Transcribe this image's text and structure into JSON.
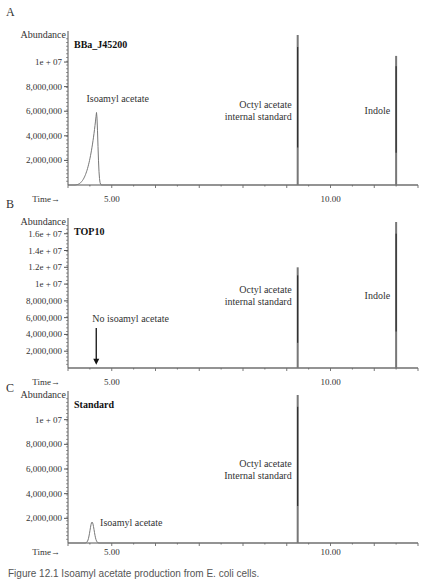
{
  "figure": {
    "caption": "Figure 12.1 Isoamyl acetate production from E. coli cells."
  },
  "colors": {
    "axis": "#555555",
    "trace": "#777777",
    "trace_dark": "#222222",
    "text": "#333333"
  },
  "chart_data": [
    {
      "type": "line",
      "panel_label": "A",
      "title": "BBa_J45200",
      "xlabel": "Time→",
      "ylabel": "Abundance",
      "x_ticks": [
        {
          "value": 5.0,
          "label": "5.00"
        },
        {
          "value": 10.0,
          "label": "10.00"
        }
      ],
      "xlim": [
        4.0,
        12.0
      ],
      "y_ticks": [
        {
          "value": 2000000,
          "label": "2,000,000"
        },
        {
          "value": 4000000,
          "label": "4,000,000"
        },
        {
          "value": 6000000,
          "label": "6,000,000"
        },
        {
          "value": 8000000,
          "label": "8,000,000"
        },
        {
          "value": 10000000,
          "label": "1e + 07"
        }
      ],
      "ylim": [
        0,
        12200000
      ],
      "peaks": [
        {
          "name": "Isoamyl acetate",
          "label_lines": [
            "Isoamyl acetate"
          ],
          "rt": 4.65,
          "height": 5900000,
          "width": 0.55,
          "shape": "broad"
        },
        {
          "name": "Octyl acetate internal standard",
          "label_lines": [
            "Octyl acetate",
            "internal standard"
          ],
          "rt": 9.25,
          "height": 12200000,
          "width": 0.03,
          "shape": "sharp"
        },
        {
          "name": "Indole",
          "label_lines": [
            "Indole"
          ],
          "rt": 11.5,
          "height": 10500000,
          "width": 0.03,
          "shape": "sharp"
        }
      ],
      "annotations": []
    },
    {
      "type": "line",
      "panel_label": "B",
      "title": "TOP10",
      "xlabel": "Time→",
      "ylabel": "Abundance",
      "x_ticks": [
        {
          "value": 5.0,
          "label": "5.00"
        },
        {
          "value": 10.0,
          "label": "10.00"
        }
      ],
      "xlim": [
        4.0,
        12.0
      ],
      "y_ticks": [
        {
          "value": 2000000,
          "label": "2,000,000"
        },
        {
          "value": 4000000,
          "label": "4,000,000"
        },
        {
          "value": 6000000,
          "label": "6,000,000"
        },
        {
          "value": 8000000,
          "label": "8,000,000"
        },
        {
          "value": 10000000,
          "label": "1e + 07"
        },
        {
          "value": 12000000,
          "label": "1.2e + 07"
        },
        {
          "value": 14000000,
          "label": "1.4e + 07"
        },
        {
          "value": 16000000,
          "label": "1.6e + 07"
        }
      ],
      "ylim": [
        0,
        17400000
      ],
      "peaks": [
        {
          "name": "Octyl acetate internal standard",
          "label_lines": [
            "Octyl acetate",
            "internal standard"
          ],
          "rt": 9.25,
          "height": 12000000,
          "width": 0.03,
          "shape": "sharp"
        },
        {
          "name": "Indole",
          "label_lines": [
            "Indole"
          ],
          "rt": 11.5,
          "height": 17400000,
          "width": 0.03,
          "shape": "sharp"
        }
      ],
      "annotations": [
        {
          "text": "No isoamyl acetate",
          "type": "arrow-down",
          "rt": 4.6,
          "from": 5000000,
          "to": 400000
        }
      ]
    },
    {
      "type": "line",
      "panel_label": "C",
      "title": "Standard",
      "xlabel": "Time→",
      "ylabel": "Abundance",
      "x_ticks": [
        {
          "value": 5.0,
          "label": "5.00"
        },
        {
          "value": 10.0,
          "label": "10.00"
        }
      ],
      "xlim": [
        4.0,
        12.0
      ],
      "y_ticks": [
        {
          "value": 2000000,
          "label": "2,000,000"
        },
        {
          "value": 4000000,
          "label": "4,000,000"
        },
        {
          "value": 6000000,
          "label": "6,000,000"
        },
        {
          "value": 8000000,
          "label": "8,000,000"
        },
        {
          "value": 10000000,
          "label": "1e + 07"
        }
      ],
      "ylim": [
        0,
        12000000
      ],
      "peaks": [
        {
          "name": "Isoamyl acetate",
          "label_lines": [
            "Isoamyl acetate"
          ],
          "rt": 4.55,
          "height": 1700000,
          "width": 0.2,
          "shape": "gauss"
        },
        {
          "name": "Octyl acetate Internal standard",
          "label_lines": [
            "Octyl acetate",
            "Internal standard"
          ],
          "rt": 9.25,
          "height": 12000000,
          "width": 0.03,
          "shape": "sharp"
        }
      ],
      "annotations": []
    }
  ]
}
